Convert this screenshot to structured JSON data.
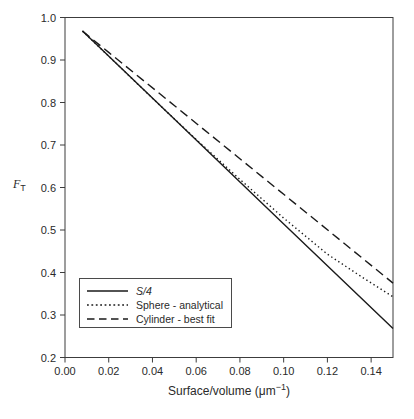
{
  "figure": {
    "background": "#ffffff",
    "line_color": "#1a1a1a",
    "frame_color": "#3c3c3c",
    "text_color": "#2a2a2a"
  },
  "labels": {
    "y_main": "F",
    "y_sub": "T",
    "x_pre": "Surface/volume (μm",
    "x_sup": "−1",
    "x_post": ")"
  },
  "chart_data": {
    "type": "line",
    "title": "",
    "xlabel": "Surface/volume (μm⁻¹)",
    "ylabel": "F_T",
    "xlim": [
      0,
      0.15
    ],
    "ylim": [
      0.2,
      1.0
    ],
    "grid": false,
    "legend_position": "lower-left",
    "x_ticks": [
      0.0,
      0.02,
      0.04,
      0.06,
      0.08,
      0.1,
      0.12,
      0.14
    ],
    "x_tick_labels": [
      "0.00",
      "0.02",
      "0.04",
      "0.06",
      "0.08",
      "0.10",
      "0.12",
      "0.14"
    ],
    "y_ticks": [
      0.2,
      0.3,
      0.4,
      0.5,
      0.6,
      0.7,
      0.8,
      0.9,
      1.0
    ],
    "y_tick_labels": [
      "0.2",
      "0.3",
      "0.4",
      "0.5",
      "0.6",
      "0.7",
      "0.8",
      "0.9",
      "1.0"
    ],
    "series": [
      {
        "name": "S/4",
        "style": "solid",
        "points": [
          [
            0.008,
            0.968
          ],
          [
            0.05,
            0.761
          ],
          [
            0.1,
            0.514
          ],
          [
            0.15,
            0.268
          ]
        ]
      },
      {
        "name": "Sphere - analytical",
        "style": "dotted",
        "points": [
          [
            0.008,
            0.968
          ],
          [
            0.02,
            0.909
          ],
          [
            0.04,
            0.81
          ],
          [
            0.06,
            0.713
          ],
          [
            0.08,
            0.619
          ],
          [
            0.1,
            0.528
          ],
          [
            0.12,
            0.443
          ],
          [
            0.135,
            0.392
          ],
          [
            0.15,
            0.343
          ]
        ]
      },
      {
        "name": "Cylinder - best fit",
        "style": "dashed",
        "points": [
          [
            0.008,
            0.968
          ],
          [
            0.02,
            0.918
          ],
          [
            0.05,
            0.793
          ],
          [
            0.1,
            0.584
          ],
          [
            0.15,
            0.375
          ]
        ]
      }
    ]
  }
}
